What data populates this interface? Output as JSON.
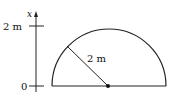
{
  "diagram": {
    "axis": {
      "label": "x",
      "ticks": [
        {
          "label": "2 m",
          "value": 2
        },
        {
          "label": "0",
          "value": 0
        }
      ]
    },
    "shape": "semicircle",
    "radius_label": "2 m",
    "center_point": "pivot-dot"
  }
}
